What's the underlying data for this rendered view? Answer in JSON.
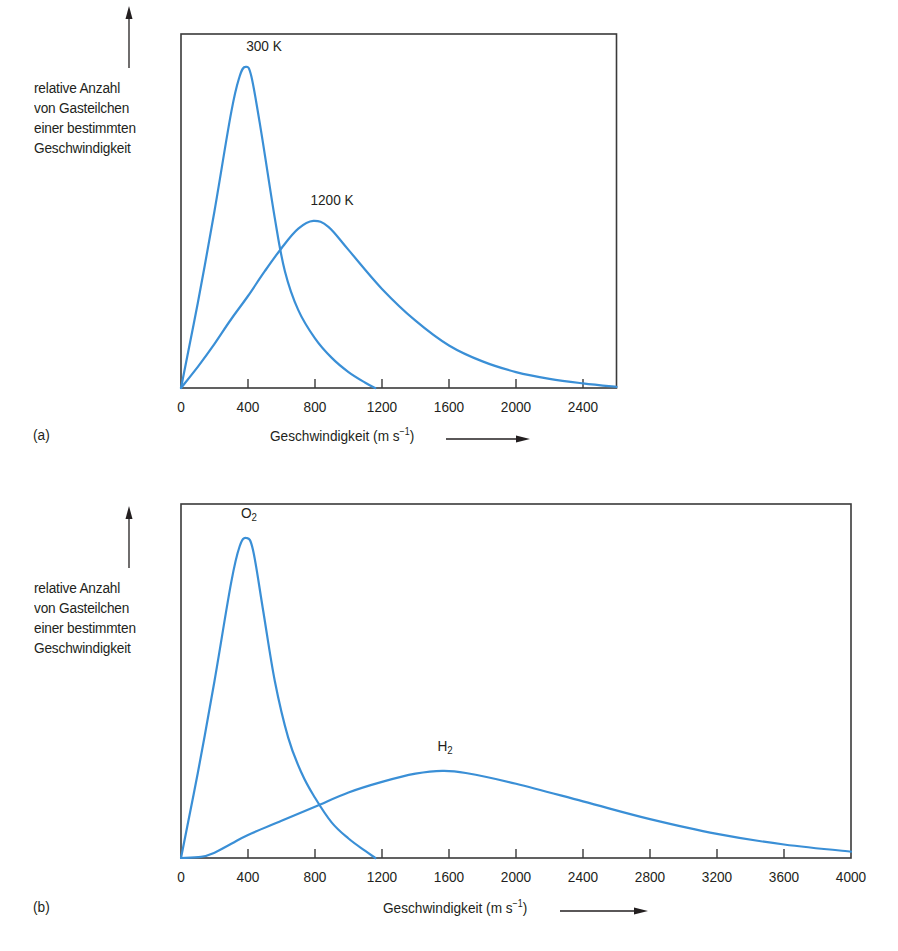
{
  "colors": {
    "curve": "#3a8fd6",
    "frame": "#3a3a3a",
    "text": "#231f20"
  },
  "chart_data": [
    {
      "id": "a",
      "panel_label": "(a)",
      "type": "line",
      "title": "",
      "ylabel": "relative Anzahl von Gasteilchen einer bestimmten Geschwindigkeit",
      "ylabel_lines": [
        "relative Anzahl",
        "von Gasteilchen",
        "einer bestimmten",
        "Geschwindigkeit"
      ],
      "xlabel": "Geschwindigkeit (ms⁻¹)",
      "xlabel_text": "Geschwindigkeit (m s",
      "xlabel_exp": "−1",
      "xlabel_close": ")",
      "xlim": [
        0,
        2600
      ],
      "ylim": [
        0,
        100
      ],
      "x_ticks": [
        0,
        400,
        800,
        1200,
        1600,
        2000,
        2400
      ],
      "x_tick_labels": [
        "0",
        "400",
        "800",
        "1200",
        "1600",
        "2000",
        "2400"
      ],
      "grid": false,
      "legend": "inline labels at curve peaks",
      "series": [
        {
          "name": "300 K",
          "label_main": "300 K",
          "label_sub": "",
          "peak_x": 385,
          "peak_y": 90.7,
          "points": [
            [
              0,
              0
            ],
            [
              100,
              24
            ],
            [
              200,
              50
            ],
            [
              300,
              78
            ],
            [
              350,
              88
            ],
            [
              385,
              90.7
            ],
            [
              420,
              88
            ],
            [
              480,
              72
            ],
            [
              560,
              48
            ],
            [
              620,
              33
            ],
            [
              700,
              22
            ],
            [
              800,
              14
            ],
            [
              900,
              8.5
            ],
            [
              1000,
              4.5
            ],
            [
              1100,
              1.5
            ],
            [
              1160,
              0
            ]
          ]
        },
        {
          "name": "1200 K",
          "label_main": "1200 K",
          "label_sub": "",
          "peak_x": 790,
          "peak_y": 47.2,
          "points": [
            [
              0,
              0
            ],
            [
              100,
              6
            ],
            [
              200,
              12.5
            ],
            [
              300,
              19.5
            ],
            [
              400,
              26
            ],
            [
              500,
              33
            ],
            [
              600,
              39.5
            ],
            [
              700,
              45
            ],
            [
              790,
              47.2
            ],
            [
              880,
              45.5
            ],
            [
              1000,
              39
            ],
            [
              1200,
              28
            ],
            [
              1400,
              19
            ],
            [
              1600,
              12
            ],
            [
              1800,
              7.5
            ],
            [
              2000,
              4.5
            ],
            [
              2200,
              2.6
            ],
            [
              2400,
              1.3
            ],
            [
              2600,
              0.3
            ]
          ]
        }
      ]
    },
    {
      "id": "b",
      "panel_label": "(b)",
      "type": "line",
      "title": "",
      "ylabel": "relative Anzahl von Gasteilchen einer bestimmten Geschwindigkeit",
      "ylabel_lines": [
        "relative Anzahl",
        "von Gasteilchen",
        "einer bestimmten",
        "Geschwindigkeit"
      ],
      "xlabel": "Geschwindigkeit (ms⁻¹)",
      "xlabel_text": "Geschwindigkeit (m s",
      "xlabel_exp": "−1",
      "xlabel_close": ")",
      "xlim": [
        0,
        4000
      ],
      "ylim": [
        0,
        100
      ],
      "x_ticks": [
        0,
        400,
        800,
        1200,
        1600,
        2000,
        2400,
        2800,
        3200,
        3600,
        4000
      ],
      "x_tick_labels": [
        "0",
        "400",
        "800",
        "1200",
        "1600",
        "2000",
        "2400",
        "2800",
        "3200",
        "3600",
        "4000"
      ],
      "grid": false,
      "legend": "inline labels at curve peaks",
      "series": [
        {
          "name": "O2",
          "label_main": "O",
          "label_sub": "2",
          "peak_x": 390,
          "peak_y": 90.4,
          "points": [
            [
              0,
              0
            ],
            [
              100,
              24
            ],
            [
              200,
              50
            ],
            [
              300,
              78
            ],
            [
              350,
              88
            ],
            [
              390,
              90.4
            ],
            [
              430,
              87
            ],
            [
              490,
              70
            ],
            [
              560,
              50
            ],
            [
              640,
              34
            ],
            [
              720,
              24
            ],
            [
              800,
              17
            ],
            [
              900,
              10
            ],
            [
              1000,
              5.5
            ],
            [
              1100,
              2
            ],
            [
              1160,
              0
            ]
          ]
        },
        {
          "name": "H2",
          "label_main": "H",
          "label_sub": "2",
          "peak_x": 1560,
          "peak_y": 24.6,
          "points": [
            [
              0,
              0
            ],
            [
              120,
              0.3
            ],
            [
              200,
              1.5
            ],
            [
              300,
              4
            ],
            [
              400,
              6.5
            ],
            [
              600,
              10.5
            ],
            [
              800,
              14.5
            ],
            [
              1000,
              18.5
            ],
            [
              1200,
              21.5
            ],
            [
              1400,
              23.8
            ],
            [
              1560,
              24.6
            ],
            [
              1700,
              24
            ],
            [
              2000,
              21
            ],
            [
              2400,
              16
            ],
            [
              2800,
              11
            ],
            [
              3200,
              6.8
            ],
            [
              3600,
              3.8
            ],
            [
              4000,
              1.8
            ]
          ]
        }
      ]
    }
  ]
}
